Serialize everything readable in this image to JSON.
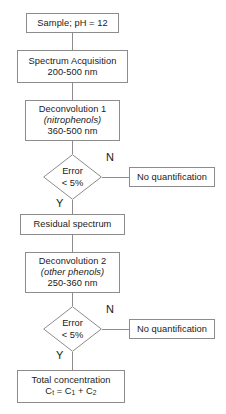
{
  "diagram": {
    "stroke_color": "#8c8c8c",
    "background_color": "#ffffff",
    "text_color": "#1a1a1a"
  },
  "nodes": {
    "sample": {
      "label": "Sample; pH = 12"
    },
    "spectrum_acquisition": {
      "line1": "Spectrum Acquisition",
      "line2": "200-500 nm"
    },
    "deconvolution1": {
      "line1": "Deconvolution 1",
      "line2": "(nitrophenols)",
      "line3": "360-500 nm"
    },
    "decision1": {
      "line1": "Error",
      "line2": "< 5%"
    },
    "no_quantification1": {
      "label": "No quantification"
    },
    "residual_spectrum": {
      "label": "Residual spectrum"
    },
    "deconvolution2": {
      "line1": "Deconvolution 2",
      "line2": "(other phenols)",
      "line3": "250-360 nm"
    },
    "decision2": {
      "line1": "Error",
      "line2": "< 5%"
    },
    "no_quantification2": {
      "label": "No quantification"
    },
    "total_concentration": {
      "line1": "Total concentration",
      "formula_prefix": "C",
      "formula_sub_t": "t",
      "formula_mid": " = C",
      "formula_sub_1": "1",
      "formula_plus": " + C",
      "formula_sub_2": "2"
    }
  },
  "branch_labels": {
    "decision1_no": "N",
    "decision1_yes": "Y",
    "decision2_no": "N",
    "decision2_yes": "Y"
  }
}
